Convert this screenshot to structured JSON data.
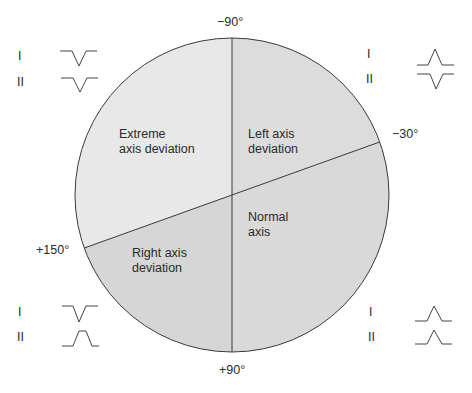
{
  "diagram": {
    "type": "cardiac-axis-quadrant-diagram",
    "colors": {
      "extreme": "#e8e8e8",
      "left": "#dcdcdc",
      "normal": "#d8d8d8",
      "right": "#d6d6d6",
      "outline": "#3a3a3a",
      "background": "#ffffff"
    },
    "angles": {
      "top": "−90°",
      "right": "−30°",
      "left": "+150°",
      "bottom": "+90°"
    },
    "regions": {
      "extreme": {
        "line1": "Extreme",
        "line2": "axis deviation"
      },
      "left": {
        "line1": "Left axis",
        "line2": "deviation"
      },
      "normal": {
        "line1": "Normal",
        "line2": "axis"
      },
      "right": {
        "line1": "Right axis",
        "line2": "deviation"
      }
    },
    "lead_panels": {
      "top_left": {
        "region": "Extreme axis deviation",
        "leads": [
          {
            "label": "I",
            "polarity": "negative"
          },
          {
            "label": "II",
            "polarity": "negative"
          }
        ]
      },
      "top_right": {
        "region": "Left axis deviation",
        "leads": [
          {
            "label": "I",
            "polarity": "positive"
          },
          {
            "label": "II",
            "polarity": "negative"
          }
        ]
      },
      "bottom_left": {
        "region": "Right axis deviation",
        "leads": [
          {
            "label": "I",
            "polarity": "negative"
          },
          {
            "label": "II",
            "polarity": "positive"
          }
        ]
      },
      "bottom_right": {
        "region": "Normal axis",
        "leads": [
          {
            "label": "I",
            "polarity": "positive"
          },
          {
            "label": "II",
            "polarity": "positive"
          }
        ]
      }
    }
  }
}
